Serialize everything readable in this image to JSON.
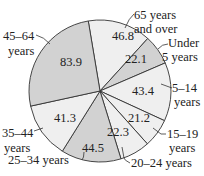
{
  "chart_data": {
    "type": "pie",
    "title": "",
    "categories": [
      "65 years and over",
      "Under 5 years",
      "5–14 years",
      "15–19 years",
      "20–24 years",
      "25–34 years",
      "35–44 years",
      "45–64 years"
    ],
    "values": [
      46.8,
      22.1,
      43.4,
      21.2,
      22.3,
      44.5,
      41.3,
      83.9
    ],
    "value_labels": [
      "46.8",
      "22.1",
      "43.4",
      "21.2",
      "22.3",
      "44.5",
      "41.3",
      "83.9"
    ],
    "label_lines": [
      [
        "65 years",
        "and over"
      ],
      [
        "Under",
        "5 years"
      ],
      [
        "5–14",
        "years"
      ],
      [
        "15–19",
        "years"
      ],
      [
        "20–24 years"
      ],
      [
        "25–34 years"
      ],
      [
        "35–44",
        "years"
      ],
      [
        "45–64",
        "years"
      ]
    ],
    "colors": [
      "#efefef",
      "#d2d2d2",
      "#efefef",
      "#efefef",
      "#efefef",
      "#d2d2d2",
      "#efefef",
      "#d2d2d2"
    ],
    "start_angle_deg": -9.5,
    "direction": "clockwise"
  }
}
